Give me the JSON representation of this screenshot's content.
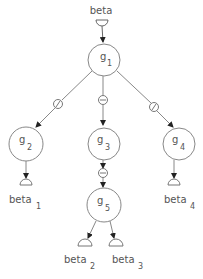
{
  "diagram": {
    "root_input": {
      "label": "beta"
    },
    "nodes": [
      {
        "id": "g1",
        "base": "g",
        "sub": "1"
      },
      {
        "id": "g2",
        "base": "g",
        "sub": "2"
      },
      {
        "id": "g3",
        "base": "g",
        "sub": "3"
      },
      {
        "id": "g4",
        "base": "g",
        "sub": "4"
      },
      {
        "id": "g5",
        "base": "g",
        "sub": "5"
      }
    ],
    "outputs": [
      {
        "base": "beta",
        "sub": "1"
      },
      {
        "base": "beta",
        "sub": "2"
      },
      {
        "base": "beta",
        "sub": "3"
      },
      {
        "base": "beta",
        "sub": "4"
      }
    ],
    "edges": [
      {
        "from": "beta",
        "to": "g1"
      },
      {
        "from": "g1",
        "to": "g2",
        "marker": "slash-circle"
      },
      {
        "from": "g1",
        "to": "g3",
        "marker": "minus-circle"
      },
      {
        "from": "g1",
        "to": "g4",
        "marker": "slash-circle"
      },
      {
        "from": "g3",
        "to": "g5",
        "marker": "minus-circle"
      },
      {
        "from": "g2",
        "to": "beta_1"
      },
      {
        "from": "g5",
        "to": "beta_2"
      },
      {
        "from": "g5",
        "to": "beta_3"
      },
      {
        "from": "g4",
        "to": "beta_4"
      }
    ]
  }
}
